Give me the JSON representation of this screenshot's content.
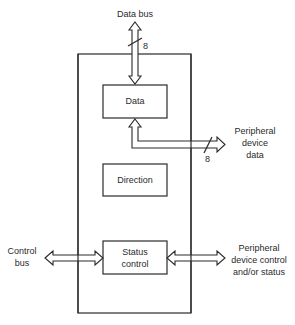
{
  "diagram": {
    "type": "block-diagram",
    "outer_block": {
      "label": ""
    },
    "blocks": [
      {
        "id": "data",
        "label": "Data"
      },
      {
        "id": "direction",
        "label": "Direction"
      },
      {
        "id": "status_control",
        "label_lines": [
          "Status",
          "control"
        ]
      }
    ],
    "connections": [
      {
        "id": "data_bus",
        "label": "Data bus",
        "width_label": "8",
        "bidirectional": true,
        "to": "data"
      },
      {
        "id": "peripheral_data",
        "label_lines": [
          "Peripheral",
          "device",
          "data"
        ],
        "width_label": "8",
        "bidirectional": true,
        "from": "data"
      },
      {
        "id": "control_bus",
        "label_lines": [
          "Control",
          "bus"
        ],
        "bidirectional": true,
        "to": "status_control"
      },
      {
        "id": "peripheral_control",
        "label_lines": [
          "Peripheral",
          "device control",
          "and/or status"
        ],
        "bidirectional": true,
        "from": "status_control"
      }
    ],
    "colors": {
      "stroke": "#2a2a2a",
      "background": "#ffffff"
    }
  }
}
